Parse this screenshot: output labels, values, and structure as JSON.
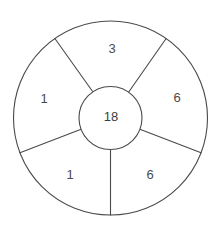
{
  "diagram": {
    "type": "wheel-sector-diagram",
    "background_color": "#ffffff",
    "stroke_color": "#4a4a4a",
    "text_color": "#4b4b4b",
    "center": {
      "cx": 110.5,
      "cy": 118.0
    },
    "outer_radius": 97.0,
    "hub_radius": 31.5,
    "hub": {
      "label": "18"
    },
    "sectors": [
      {
        "name": "sector-top",
        "label": "3",
        "start_angle_deg": -55,
        "end_angle_deg": -125,
        "label_x": 112,
        "label_y": 50
      },
      {
        "name": "sector-right",
        "label": "6",
        "start_angle_deg": -55,
        "end_angle_deg": 21,
        "label_x": 177,
        "label_y": 99
      },
      {
        "name": "sector-bottom-right",
        "label": "6",
        "start_angle_deg": 21,
        "end_angle_deg": 90,
        "label_x": 150,
        "label_y": 176
      },
      {
        "name": "sector-bottom-left",
        "label": "1",
        "start_angle_deg": 90,
        "end_angle_deg": 159,
        "label_x": 70,
        "label_y": 176
      },
      {
        "name": "sector-left",
        "label": "1",
        "start_angle_deg": 159,
        "end_angle_deg": 235,
        "label_x": 44,
        "label_y": 100
      }
    ],
    "spokes": [
      {
        "name": "spoke-upper-left",
        "angle_deg": -125
      },
      {
        "name": "spoke-upper-right",
        "angle_deg": -55
      },
      {
        "name": "spoke-lower-right",
        "angle_deg": 21
      },
      {
        "name": "spoke-bottom",
        "angle_deg": 90
      },
      {
        "name": "spoke-lower-left",
        "angle_deg": 159
      }
    ]
  }
}
